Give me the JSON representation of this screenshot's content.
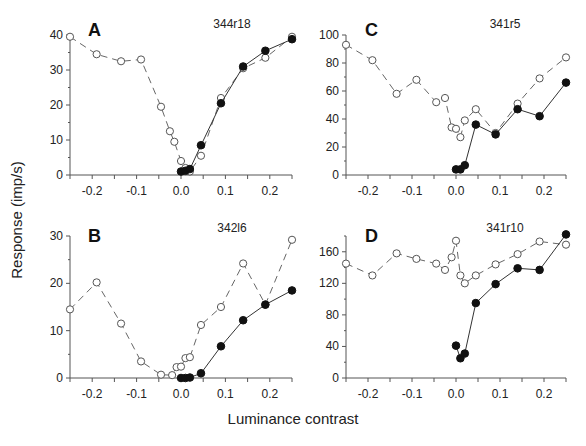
{
  "figure": {
    "ylabel": "Response (imp/s)",
    "xlabel": "Luminance contrast"
  },
  "chart_data": [
    {
      "type": "line",
      "panel": "A",
      "title": "344r18",
      "xlabel": "Luminance contrast",
      "ylabel": "Response (imp/s)",
      "xlim": [
        -0.25,
        0.25
      ],
      "ylim": [
        0,
        40
      ],
      "xticks": [
        "-0.2",
        "-0.1",
        "0.0",
        "0.1",
        "0.2"
      ],
      "yticks": [
        "0",
        "10",
        "20",
        "30",
        "40"
      ],
      "ytick_values": [
        0,
        10,
        20,
        30,
        40
      ],
      "grid": false,
      "series": [
        {
          "name": "open (dashed)",
          "marker": "open-circle",
          "line": "dashed",
          "x": [
            -0.25,
            -0.19,
            -0.135,
            -0.09,
            -0.045,
            -0.025,
            -0.015,
            0.0,
            0.01,
            0.02,
            0.045,
            0.09,
            0.14,
            0.19,
            0.25
          ],
          "y": [
            39.5,
            34.5,
            32.5,
            33,
            19.5,
            12.5,
            9.5,
            4,
            2,
            1,
            5.5,
            22,
            30.5,
            33.5,
            39.5
          ]
        },
        {
          "name": "filled (solid)",
          "marker": "filled-circle",
          "line": "solid",
          "x": [
            0.0,
            0.01,
            0.02,
            0.045,
            0.09,
            0.14,
            0.19,
            0.25
          ],
          "y": [
            1,
            1.2,
            1.7,
            8.5,
            20.5,
            31,
            35.5,
            38.8
          ]
        }
      ]
    },
    {
      "type": "line",
      "panel": "B",
      "title": "342l6",
      "xlabel": "Luminance contrast",
      "ylabel": "Response (imp/s)",
      "xlim": [
        -0.25,
        0.25
      ],
      "ylim": [
        0,
        30
      ],
      "xticks": [
        "-0.2",
        "-0.1",
        "0.0",
        "0.1",
        "0.2"
      ],
      "yticks": [
        "0",
        "10",
        "20",
        "30"
      ],
      "ytick_values": [
        0,
        10,
        20,
        30
      ],
      "grid": false,
      "series": [
        {
          "name": "open (dashed)",
          "marker": "open-circle",
          "line": "dashed",
          "x": [
            -0.25,
            -0.19,
            -0.135,
            -0.09,
            -0.045,
            -0.02,
            -0.01,
            0.0,
            0.01,
            0.02,
            0.045,
            0.09,
            0.14,
            0.19,
            0.25
          ],
          "y": [
            14.5,
            20.2,
            11.5,
            3.5,
            0.7,
            0.6,
            2.3,
            2.4,
            4.2,
            4.4,
            11.2,
            15,
            24.2,
            15.5,
            29.2
          ]
        },
        {
          "name": "filled (solid)",
          "marker": "filled-circle",
          "line": "solid",
          "x": [
            0.0,
            0.01,
            0.02,
            0.045,
            0.09,
            0.14,
            0.19,
            0.25
          ],
          "y": [
            0,
            0,
            0.1,
            1,
            6.7,
            12.2,
            15.5,
            18.5
          ]
        }
      ]
    },
    {
      "type": "line",
      "panel": "C",
      "title": "341r5",
      "xlabel": "Luminance contrast",
      "ylabel": "Response (imp/s)",
      "xlim": [
        -0.25,
        0.25
      ],
      "ylim": [
        0,
        100
      ],
      "xticks": [
        "-0.2",
        "-0.1",
        "0.0",
        "0.1",
        "0.2"
      ],
      "yticks": [
        "0",
        "20",
        "40",
        "60",
        "80",
        "100"
      ],
      "ytick_values": [
        0,
        20,
        40,
        60,
        80,
        100
      ],
      "grid": false,
      "series": [
        {
          "name": "open (dashed)",
          "marker": "open-circle",
          "line": "dashed",
          "x": [
            -0.25,
            -0.19,
            -0.135,
            -0.09,
            -0.045,
            -0.025,
            -0.01,
            0.0,
            0.01,
            0.02,
            0.045,
            0.09,
            0.14,
            0.19,
            0.25
          ],
          "y": [
            93,
            82,
            58,
            68,
            52,
            55,
            34,
            33,
            27,
            39,
            47,
            30,
            51,
            69,
            84
          ]
        },
        {
          "name": "filled (solid)",
          "marker": "filled-circle",
          "line": "solid",
          "x": [
            0.0,
            0.01,
            0.02,
            0.045,
            0.09,
            0.14,
            0.19,
            0.25
          ],
          "y": [
            4,
            4,
            7,
            36,
            29,
            47,
            42,
            66
          ]
        }
      ]
    },
    {
      "type": "line",
      "panel": "D",
      "title": "341r10",
      "xlabel": "Luminance contrast",
      "ylabel": "Response (imp/s)",
      "xlim": [
        -0.25,
        0.25
      ],
      "ylim": [
        0,
        180
      ],
      "xticks": [
        "-0.2",
        "-0.1",
        "0.0",
        "0.1",
        "0.2"
      ],
      "yticks": [
        "0",
        "40",
        "80",
        "120",
        "160"
      ],
      "ytick_values": [
        0,
        40,
        80,
        120,
        160
      ],
      "grid": false,
      "series": [
        {
          "name": "open (dashed)",
          "marker": "open-circle",
          "line": "dashed",
          "x": [
            -0.25,
            -0.19,
            -0.135,
            -0.09,
            -0.045,
            -0.025,
            -0.01,
            0.0,
            0.01,
            0.02,
            0.045,
            0.09,
            0.14,
            0.19,
            0.25
          ],
          "y": [
            145,
            130,
            158,
            151,
            145,
            137,
            153,
            174,
            130,
            120,
            130,
            144,
            157,
            173,
            169
          ]
        },
        {
          "name": "filled (solid)",
          "marker": "filled-circle",
          "line": "solid",
          "x": [
            0.0,
            0.01,
            0.02,
            0.045,
            0.09,
            0.14,
            0.19,
            0.25
          ],
          "y": [
            41,
            25,
            31,
            95,
            119,
            139,
            137,
            182
          ]
        }
      ]
    }
  ],
  "layout": {
    "panels": [
      {
        "x0": 70,
        "x1": 292,
        "y0": 175,
        "y1": 35,
        "label_x": 88,
        "label_y": 22,
        "title_x": 232,
        "title_y": 28
      },
      {
        "x0": 70,
        "x1": 292,
        "y0": 378,
        "y1": 236,
        "label_x": 88,
        "label_y": 228,
        "title_x": 232,
        "title_y": 232
      },
      {
        "x0": 346,
        "x1": 566,
        "y0": 175,
        "y1": 35,
        "label_x": 365,
        "label_y": 22,
        "title_x": 505,
        "title_y": 28
      },
      {
        "x0": 346,
        "x1": 566,
        "y0": 378,
        "y1": 236,
        "label_x": 365,
        "label_y": 228,
        "title_x": 505,
        "title_y": 232
      }
    ]
  }
}
